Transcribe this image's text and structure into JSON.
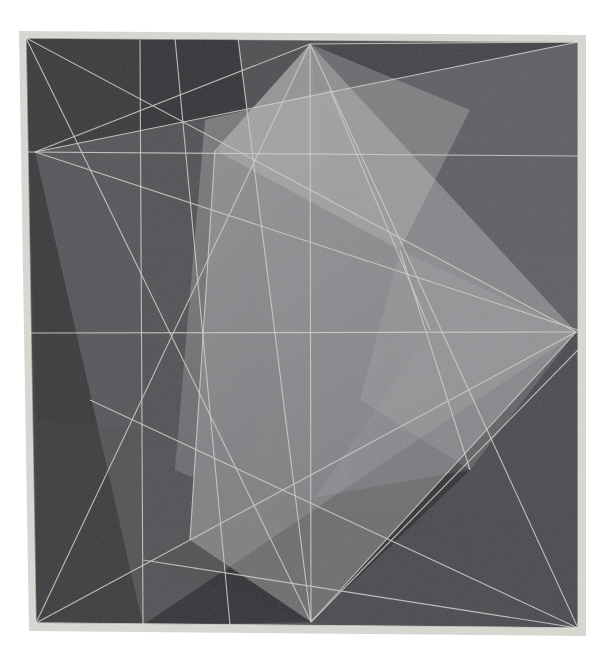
{
  "artwork": {
    "title": "Abstract Geometric Composition",
    "medium_appearance": "textured painting / drawing with intersecting translucent planes",
    "canvas": {
      "width": 614,
      "height": 659,
      "background_color": "#ffffff"
    },
    "plate": {
      "name": "painted-plate",
      "corners": {
        "top_left": [
          26,
          38
        ],
        "top_right": [
          578,
          42
        ],
        "bottom_right": [
          578,
          628
        ],
        "bottom_left": [
          36,
          623
        ]
      },
      "border_color": "#d8d6d0",
      "border_width": 7,
      "base_color": "#4a4a4c"
    },
    "palette": {
      "base_dark": "#46464a",
      "darkest_wedge": "#2c2c30",
      "dark_wedge": "#343438",
      "mid_dark": "#3c3c40",
      "mid": "#55555a",
      "mid_light": "#6e6e72",
      "light": "#86868a",
      "lightest": "#9a9a9c",
      "line_color": "#c9c7c2",
      "plate_edge": "#d6d4ce",
      "paper_white": "#ffffff"
    },
    "anchor_points": [
      {
        "name": "top-apex",
        "x": 310,
        "y": 44
      },
      {
        "name": "top-left-corner",
        "x": 26,
        "y": 38
      },
      {
        "name": "top-right-corner",
        "x": 578,
        "y": 42
      },
      {
        "name": "left-edge-convergence",
        "x": 35,
        "y": 152
      },
      {
        "name": "right-edge-convergence",
        "x": 576,
        "y": 332
      },
      {
        "name": "bottom-apex",
        "x": 311,
        "y": 622
      },
      {
        "name": "bottom-left-corner",
        "x": 36,
        "y": 623
      },
      {
        "name": "bottom-right-corner",
        "x": 578,
        "y": 628
      },
      {
        "name": "vertical-axis-top",
        "x": 140,
        "y": 42
      },
      {
        "name": "vertical-axis-bottom",
        "x": 143,
        "y": 625
      }
    ],
    "construction_lines": [
      {
        "name": "horizontal-upper-rule",
        "from": [
          26,
          152
        ],
        "to": [
          578,
          156
        ]
      },
      {
        "name": "horizontal-mid-rule",
        "from": [
          28,
          333
        ],
        "to": [
          578,
          332
        ]
      },
      {
        "name": "vertical-left-rule",
        "from": [
          140,
          40
        ],
        "to": [
          143,
          625
        ]
      },
      {
        "name": "vertical-center-rule",
        "from": [
          310,
          44
        ],
        "to": [
          311,
          622
        ]
      },
      {
        "name": "diagonal-topleft-to-right",
        "from": [
          26,
          38
        ],
        "to": [
          576,
          332
        ]
      },
      {
        "name": "diagonal-left-conv-to-topright",
        "from": [
          35,
          152
        ],
        "to": [
          578,
          42
        ]
      },
      {
        "name": "diagonal-left-conv-to-topapex",
        "from": [
          35,
          152
        ],
        "to": [
          310,
          44
        ]
      },
      {
        "name": "diagonal-left-conv-to-bottomright",
        "from": [
          35,
          152
        ],
        "to": [
          578,
          628
        ]
      },
      {
        "name": "diagonal-topapex-to-bottomleft",
        "from": [
          310,
          44
        ],
        "to": [
          36,
          623
        ]
      },
      {
        "name": "diagonal-topapex-to-bottomright",
        "from": [
          310,
          44
        ],
        "to": [
          578,
          628
        ]
      },
      {
        "name": "diagonal-bottomleft-to-rightconv",
        "from": [
          36,
          623
        ],
        "to": [
          576,
          332
        ]
      },
      {
        "name": "diagonal-bottomapex-to-rightconv",
        "from": [
          311,
          622
        ],
        "to": [
          576,
          332
        ]
      },
      {
        "name": "diagonal-bottomapex-to-topright-steep",
        "from": [
          311,
          622
        ],
        "to": [
          238,
          38
        ]
      },
      {
        "name": "diagonal-rightconv-to-bottomapex-low",
        "from": [
          578,
          628
        ],
        "to": [
          90,
          400
        ]
      }
    ],
    "facets": [
      {
        "name": "facet-upper-left-dark",
        "tone": "#343438"
      },
      {
        "name": "facet-left-column-darkest",
        "tone": "#2e2e32"
      },
      {
        "name": "facet-center-light-band",
        "tone": "#8a8a8d"
      },
      {
        "name": "facet-center-lightest-wedge",
        "tone": "#9a9a9c"
      },
      {
        "name": "facet-upper-right-dark",
        "tone": "#3a3a3e"
      },
      {
        "name": "facet-right-mid-light",
        "tone": "#7c7c80"
      },
      {
        "name": "facet-lower-right-dark",
        "tone": "#45454a"
      },
      {
        "name": "facet-lower-center-darkest",
        "tone": "#2a2a2e"
      },
      {
        "name": "facet-lower-left-mid",
        "tone": "#515156"
      }
    ]
  }
}
